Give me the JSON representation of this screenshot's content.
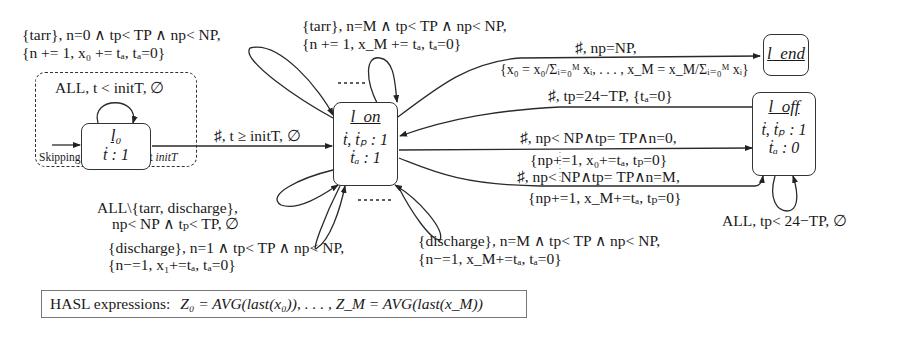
{
  "states": {
    "l0": {
      "name": "l₀",
      "flow": "ṫ : 1"
    },
    "lon": {
      "name": "l_on",
      "flow1": "ṫ, ṫₚ : 1",
      "flow2": "ṫₐ : 1"
    },
    "loff": {
      "name": "l_off",
      "flow1": "ṫ, ṫₚ : 1",
      "flow2": "ṫₐ : 0"
    },
    "lend": {
      "name": "l_end"
    }
  },
  "initial_region": {
    "caption": "Skipping initial transient",
    "caption_italic": "initT",
    "self_loop_label": "ALL, t < initT, ∅"
  },
  "edges": {
    "l0_to_lon": "♯, t ≥ initT, ∅",
    "tarr_n0_line1": "{tarr}, n=0 ∧ tp< TP ∧ np< NP,",
    "tarr_n0_line2": "{n += 1, x₀ += tₐ, tₐ=0}",
    "tarr_nM_line1": "{tarr}, n=M ∧ tp< TP ∧ np< NP,",
    "tarr_nM_line2": "{n += 1, x_M += tₐ, tₐ=0}",
    "lon_to_lend_line1": "♯, np=NP,",
    "lon_to_lend_line2": "{x₀ = x₀/Σᵢ₌₀ᴹ xᵢ, . . . , x_M = x_M/Σᵢ₌₀ᴹ xᵢ}",
    "loff_to_lon": "♯, tp=24−TP, {tₐ=0}",
    "lon_to_loff_n0_line1": "♯, np< NP∧tp= TP∧n=0,",
    "lon_to_loff_n0_line2": "{np+=1, x₀+=tₐ, tₚ=0}",
    "lon_to_loff_nM_line1": "♯, np< NP∧tp= TP∧n=M,",
    "lon_to_loff_nM_line2": "{np+=1, x_M+=tₐ, tₚ=0}",
    "loff_self_loop": "ALL, tp< 24−TP, ∅",
    "lon_self_all_line1": "ALL\\{tarr, discharge},",
    "lon_self_all_line2": "np< NP ∧ tₚ< TP, ∅",
    "discharge_n1_line1": "{discharge}, n=1 ∧ tp< TP ∧ np< NP,",
    "discharge_n1_line2": "{n−=1, x₁+=tₐ, tₐ=0}",
    "discharge_nM_line1": "{discharge}, n=M ∧ tp< TP ∧ np< NP,",
    "discharge_nM_line2": "{n−=1, x_M+=tₐ, tₐ=0}"
  },
  "hasl": {
    "label": "HASL expressions:",
    "expression": "Z₀ = AVG(last(x₀)), . . . , Z_M = AVG(last(x_M))"
  }
}
